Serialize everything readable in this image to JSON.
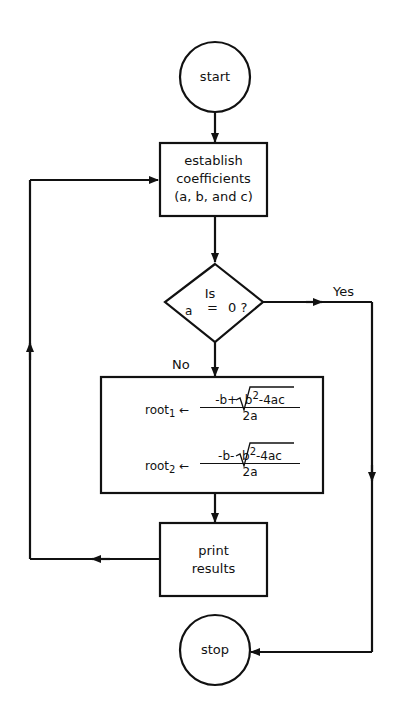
{
  "diagram": {
    "type": "flowchart",
    "nodes": {
      "start": {
        "shape": "circle",
        "label": "start"
      },
      "establish": {
        "shape": "process",
        "lines": [
          "establish",
          "coefficients",
          "(a, b, and c)"
        ]
      },
      "decision": {
        "shape": "decision",
        "line1": "Is",
        "var": "a",
        "op": "=",
        "val": "0 ?"
      },
      "compute": {
        "shape": "process",
        "root1": {
          "name": "root",
          "sub": "1",
          "arrow": "←",
          "numerator_pre": "-b+",
          "radicand_base": "b",
          "radicand_exp": "2",
          "radicand_rest": "-4ac",
          "denominator": "2a"
        },
        "root2": {
          "name": "root",
          "sub": "2",
          "arrow": "←",
          "numerator_pre": "-b-",
          "radicand_base": "b",
          "radicand_exp": "2",
          "radicand_rest": "-4ac",
          "denominator": "2a"
        }
      },
      "print": {
        "shape": "process",
        "lines": [
          "print",
          "results"
        ]
      },
      "stop": {
        "shape": "circle",
        "label": "stop"
      }
    },
    "edges": {
      "yes_label": "Yes",
      "no_label": "No"
    }
  }
}
